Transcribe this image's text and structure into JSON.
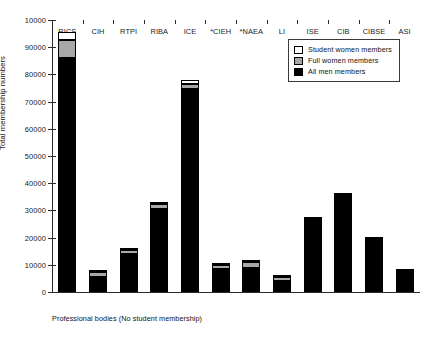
{
  "chart_data": {
    "type": "bar",
    "stacked": true,
    "title": "",
    "xlabel": "Professional bodies (No student membership)",
    "ylabel": "Total membership numbers",
    "ylim": [
      0,
      100000
    ],
    "ytick_step": 10000,
    "ytick_labels": [
      "0",
      "10000",
      "20000",
      "30000",
      "40000",
      "50000",
      "60000",
      "70000",
      "80000",
      "90000",
      "10000"
    ],
    "ytick_values": [
      0,
      10000,
      20000,
      30000,
      40000,
      50000,
      60000,
      70000,
      80000,
      90000,
      100000
    ],
    "grid": false,
    "legend_position": "top-right",
    "categories": [
      "RICS",
      "CIH",
      "RTPI",
      "RIBA",
      "ICE",
      "*CIEH",
      "*NAEA",
      "LI",
      "ISE",
      "CIB",
      "CIBSE",
      "ASI"
    ],
    "series": [
      {
        "name": "All men members",
        "color": "#000000",
        "values": [
          86000,
          5400,
          14000,
          30500,
          74500,
          8400,
          8800,
          4200,
          26400,
          35200,
          19300,
          7400
        ]
      },
      {
        "name": "Full women members",
        "color": "#a8a8a8",
        "values": [
          6500,
          1800,
          1400,
          1700,
          2000,
          1500,
          2100,
          1500,
          300,
          500,
          300,
          200
        ]
      },
      {
        "name": "Student women members",
        "color": "#ffffff",
        "values": [
          3000,
          900,
          900,
          1000,
          1500,
          300,
          300,
          300,
          700,
          200,
          100,
          100
        ]
      }
    ],
    "totals": [
      95500,
      8100,
      16300,
      33200,
      78000,
      10200,
      11200,
      6000,
      27400,
      35900,
      19700,
      7700
    ]
  },
  "legend": {
    "entries": [
      {
        "label": "Student women members",
        "swatch": "#ffffff"
      },
      {
        "label": "Full women members",
        "swatch": "#a8a8a8"
      },
      {
        "label": "All men members",
        "swatch": "#000000"
      }
    ]
  }
}
